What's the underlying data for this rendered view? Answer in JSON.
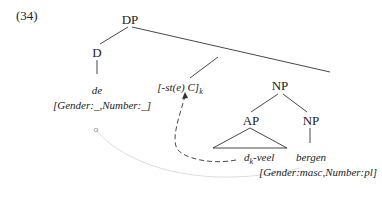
{
  "example_number": "(34)",
  "tree": {
    "root": "DP",
    "d_node": "D",
    "d_word": "de",
    "d_features": "[Gender:_,Number:_]",
    "suffix": "[-st(e) C]",
    "suffix_subscript": "k",
    "np_upper": "NP",
    "ap": "AP",
    "np_lower": "NP",
    "ap_word_prefix": "d",
    "ap_word_subscript": "k",
    "ap_word_suffix": "-veel",
    "noun": "bergen",
    "noun_features": "[Gender:masc,Number:pl]"
  }
}
